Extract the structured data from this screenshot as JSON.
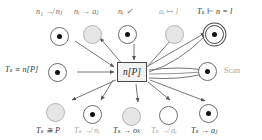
{
  "diagram": {
    "type": "transition-graph",
    "center": {
      "label": "n[P]",
      "shape": "rectangle"
    },
    "right_annotation": "Scan",
    "nodes": [
      {
        "id": "top-1",
        "label": "n₁ ↛ nⱼ",
        "label_tone": "normal",
        "marker": "filled",
        "style": "ring",
        "x": 59,
        "y": 27,
        "label_x": 36,
        "label_y": 8,
        "edge_dir": "to-center"
      },
      {
        "id": "top-2",
        "label": "nᵢ → aⱼ",
        "label_tone": "normal",
        "marker": "empty",
        "style": "gray",
        "x": 92,
        "y": 25,
        "label_x": 74,
        "label_y": 8,
        "edge_dir": "from-center"
      },
      {
        "id": "top-3",
        "label": "nᵢ ✓",
        "label_tone": "normal",
        "marker": "filled",
        "style": "ring",
        "x": 127,
        "y": 25,
        "label_x": 118,
        "label_y": 8,
        "edge_dir": "to-center"
      },
      {
        "id": "top-4",
        "label": "aᵢ ↦ l",
        "label_tone": "faint",
        "marker": "empty",
        "style": "gray",
        "x": 174,
        "y": 25,
        "label_x": 160,
        "label_y": 8,
        "edge_dir": "from-center"
      },
      {
        "id": "top-5",
        "label": "Tₛ ⊢ n = l",
        "label_tone": "dark",
        "marker": "filled",
        "style": "double",
        "x": 214,
        "y": 25,
        "label_x": 199,
        "label_y": 8,
        "edge_dir": "from-center"
      },
      {
        "id": "left-1",
        "label": "Tₛ ≡ n[P]",
        "label_tone": "dark",
        "marker": "filled",
        "style": "ring",
        "x": 57,
        "y": 64,
        "label_x": 6,
        "label_y": 66,
        "edge_dir": "to-center"
      },
      {
        "id": "right-1",
        "label": "",
        "label_tone": "normal",
        "marker": "filled",
        "style": "ring",
        "x": 207,
        "y": 63,
        "label_x": 0,
        "label_y": 0,
        "edge_dir": "from-center"
      },
      {
        "id": "bot-1",
        "label": "Tₛ ≅ P",
        "label_tone": "dark",
        "marker": "empty",
        "style": "gray",
        "x": 55,
        "y": 103,
        "label_x": 37,
        "label_y": 127,
        "edge_dir": "from-center"
      },
      {
        "id": "bot-2",
        "label": "Tₛ ↛ nᵢ",
        "label_tone": "faint",
        "marker": "filled",
        "style": "ring",
        "x": 92,
        "y": 105,
        "label_x": 75,
        "label_y": 127,
        "edge_dir": "to-center"
      },
      {
        "id": "bot-3",
        "label": "Tₛ → oₖ",
        "label_tone": "dark",
        "marker": "empty",
        "style": "gray",
        "x": 131,
        "y": 107,
        "label_x": 114,
        "label_y": 127,
        "edge_dir": "from-center"
      },
      {
        "id": "bot-4",
        "label": "Tₛ ↛ aᵢ",
        "label_tone": "faint",
        "marker": "empty",
        "style": "ring",
        "x": 168,
        "y": 106,
        "label_x": 152,
        "label_y": 127,
        "edge_dir": "from-center"
      },
      {
        "id": "bot-5",
        "label": "Tₛ → aⱼ",
        "label_tone": "dark",
        "marker": "filled",
        "style": "ring",
        "x": 208,
        "y": 104,
        "label_x": 192,
        "label_y": 127,
        "edge_dir": "from-center"
      }
    ]
  }
}
